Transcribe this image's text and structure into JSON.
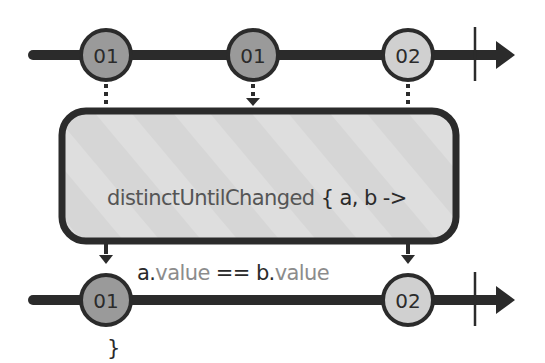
{
  "diagram": {
    "type": "marble-diagram",
    "operator": "distinctUntilChanged",
    "colors": {
      "line": "#2b2b2b",
      "marble_01": "#9a9a9a",
      "marble_02": "#d0d0d0",
      "box_fill": "#d9d9d9",
      "box_stroke": "#2b2b2b",
      "background": "#ffffff"
    },
    "input_stream": {
      "marbles": [
        {
          "label": "01",
          "x": 106
        },
        {
          "label": "01",
          "x": 253
        },
        {
          "label": "02",
          "x": 408
        }
      ],
      "completed": true
    },
    "operator_box": {
      "line1_fn": "distinctUntilChanged",
      "line1_rest": " { a, b ->",
      "line2_a": "a.",
      "line2_value1": "value",
      "line2_eq": " == ",
      "line2_b": "b.",
      "line2_value2": "value",
      "line3": "}"
    },
    "output_stream": {
      "marbles": [
        {
          "label": "01",
          "x": 106
        },
        {
          "label": "02",
          "x": 408
        }
      ],
      "completed": true
    }
  }
}
